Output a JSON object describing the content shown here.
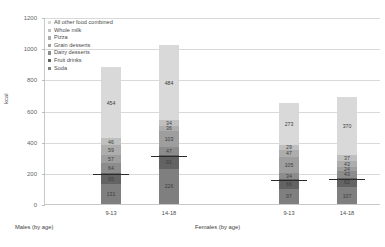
{
  "chart_data": {
    "type": "bar",
    "stacked": true,
    "title": "",
    "xlabel": "",
    "ylabel": "kcal",
    "ylim": [
      0,
      1200
    ],
    "ytick_values": [
      0,
      200,
      400,
      600,
      800,
      1000,
      1200
    ],
    "ytick_labels": [
      "0",
      "200",
      "400",
      "600",
      "800",
      "1000",
      "1200"
    ],
    "grid": true,
    "legend_position": "top-left",
    "categories": [
      "9-13",
      "14-18",
      "9-13",
      "14-18"
    ],
    "group_labels": [
      "Males (by age)",
      "Females (by age)"
    ],
    "series": [
      {
        "name": "Soda",
        "color": "#7f7f7f",
        "values": [
          131,
          226,
          97,
          107
        ]
      },
      {
        "name": "Fruit drinks",
        "color": "#636363",
        "values": [
          65,
          91,
          66,
          62
        ]
      },
      {
        "name": "Dairy desserts",
        "color": "#8c8c8c",
        "values": [
          64,
          47,
          34,
          43
        ]
      },
      {
        "name": "Grain desserts",
        "color": "#9e9e9e",
        "values": [
          57,
          103,
          105,
          24
        ]
      },
      {
        "name": "Pizza",
        "color": "#adadad",
        "values": [
          59,
          36,
          47,
          43
        ]
      },
      {
        "name": "Whole milk",
        "color": "#bfbfbf",
        "values": [
          46,
          34,
          29,
          37
        ]
      },
      {
        "name": "All other food combined",
        "color": "#d9d9d9",
        "values": [
          454,
          484,
          273,
          370
        ]
      }
    ],
    "totals": [
      876,
      1021,
      651,
      686
    ],
    "error_markers": [
      196,
      317,
      163,
      169
    ]
  },
  "legend": {
    "items": [
      {
        "label": "All other food combined",
        "color": "#d9d9d9"
      },
      {
        "label": "Whole milk",
        "color": "#bfbfbf"
      },
      {
        "label": "Pizza",
        "color": "#adadad"
      },
      {
        "label": "Grain desserts",
        "color": "#9e9e9e"
      },
      {
        "label": "Dairy desserts",
        "color": "#8c8c8c"
      },
      {
        "label": "Fruit drinks",
        "color": "#636363"
      },
      {
        "label": "Soda",
        "color": "#7f7f7f"
      }
    ]
  }
}
